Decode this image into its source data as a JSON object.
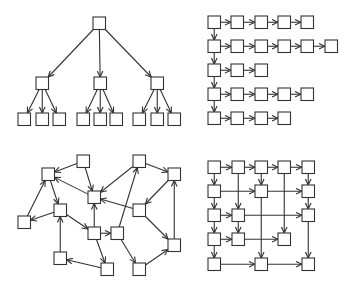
{
  "style": {
    "stroke": "#333333",
    "fill": "#ffffff",
    "node_size": 12.5
  },
  "panels": [
    {
      "name": "tree",
      "nodes": {
        "r": [
          93,
          17
        ],
        "m0": [
          36,
          77
        ],
        "m1": [
          94,
          77
        ],
        "m2": [
          151,
          77
        ],
        "l0": [
          18,
          113
        ],
        "l1": [
          36,
          113
        ],
        "l2": [
          53,
          113
        ],
        "l3": [
          77,
          113
        ],
        "l4": [
          94,
          113
        ],
        "l5": [
          110,
          113
        ],
        "l6": [
          133,
          113
        ],
        "l7": [
          151,
          113
        ],
        "l8": [
          168,
          113
        ]
      },
      "edges": [
        [
          "r",
          "m0"
        ],
        [
          "r",
          "m1"
        ],
        [
          "r",
          "m2"
        ],
        [
          "m0",
          "l0"
        ],
        [
          "m0",
          "l1"
        ],
        [
          "m0",
          "l2"
        ],
        [
          "m1",
          "l3"
        ],
        [
          "m1",
          "l4"
        ],
        [
          "m1",
          "l5"
        ],
        [
          "m2",
          "l6"
        ],
        [
          "m2",
          "l7"
        ],
        [
          "m2",
          "l8"
        ]
      ]
    },
    {
      "name": "lists",
      "cols_x": [
        208,
        231,
        255,
        278,
        301,
        325
      ],
      "rows_y": [
        16,
        40,
        64,
        88,
        112
      ],
      "row_lengths": [
        5,
        6,
        3,
        5,
        4
      ]
    },
    {
      "name": "random-graph",
      "nodes": {
        "A": [
          77,
          155
        ],
        "B": [
          42,
          168
        ],
        "C": [
          88,
          191
        ],
        "D": [
          54,
          204
        ],
        "E": [
          18,
          216
        ],
        "F": [
          88,
          227
        ],
        "G": [
          111,
          227
        ],
        "H": [
          54,
          252
        ],
        "I": [
          101,
          263
        ],
        "J": [
          133,
          155
        ],
        "K": [
          168,
          168
        ],
        "L": [
          133,
          204
        ],
        "M": [
          168,
          239
        ],
        "N": [
          133,
          263
        ]
      },
      "edges": [
        [
          "A",
          "B"
        ],
        [
          "A",
          "C"
        ],
        [
          "B",
          "D"
        ],
        [
          "E",
          "B"
        ],
        [
          "D",
          "E"
        ],
        [
          "C",
          "B"
        ],
        [
          "D",
          "F"
        ],
        [
          "F",
          "C"
        ],
        [
          "F",
          "G"
        ],
        [
          "F",
          "I"
        ],
        [
          "H",
          "D"
        ],
        [
          "I",
          "H"
        ],
        [
          "G",
          "J"
        ],
        [
          "J",
          "C"
        ],
        [
          "J",
          "K"
        ],
        [
          "K",
          "L"
        ],
        [
          "L",
          "C"
        ],
        [
          "L",
          "M"
        ],
        [
          "M",
          "K"
        ],
        [
          "G",
          "N"
        ],
        [
          "N",
          "M"
        ]
      ]
    },
    {
      "name": "grid",
      "cols_x": [
        208,
        232,
        255,
        278,
        302
      ],
      "rows_y": [
        161,
        185,
        209,
        233,
        258
      ],
      "nodes": {
        "a0": [
          0,
          0
        ],
        "a1": [
          1,
          0
        ],
        "a2": [
          2,
          0
        ],
        "a3": [
          3,
          0
        ],
        "a4": [
          4,
          0
        ],
        "b0": [
          0,
          1
        ],
        "b2": [
          2,
          1
        ],
        "b4": [
          4,
          1
        ],
        "c0": [
          0,
          2
        ],
        "c1": [
          1,
          2
        ],
        "c4": [
          4,
          2
        ],
        "d0": [
          0,
          3
        ],
        "d1": [
          1,
          3
        ],
        "d3": [
          3,
          3
        ],
        "e0": [
          0,
          4
        ],
        "e2": [
          2,
          4
        ],
        "e4": [
          4,
          4
        ]
      },
      "edges": [
        [
          "a0",
          "a1"
        ],
        [
          "a1",
          "a2"
        ],
        [
          "a2",
          "a3"
        ],
        [
          "a3",
          "a4"
        ],
        [
          "a0",
          "b0"
        ],
        [
          "a2",
          "b2"
        ],
        [
          "a4",
          "b4"
        ],
        [
          "a1",
          "c1"
        ],
        [
          "a3",
          "d3"
        ],
        [
          "b0",
          "b2"
        ],
        [
          "b2",
          "b4"
        ],
        [
          "b0",
          "c0"
        ],
        [
          "b4",
          "c4"
        ],
        [
          "b2",
          "e2"
        ],
        [
          "c0",
          "c1"
        ],
        [
          "c1",
          "c4"
        ],
        [
          "c0",
          "d0"
        ],
        [
          "c1",
          "d1"
        ],
        [
          "c4",
          "e4"
        ],
        [
          "d0",
          "d1"
        ],
        [
          "d1",
          "d3"
        ],
        [
          "d0",
          "e0"
        ],
        [
          "e0",
          "e2"
        ],
        [
          "e2",
          "e4"
        ]
      ]
    }
  ]
}
